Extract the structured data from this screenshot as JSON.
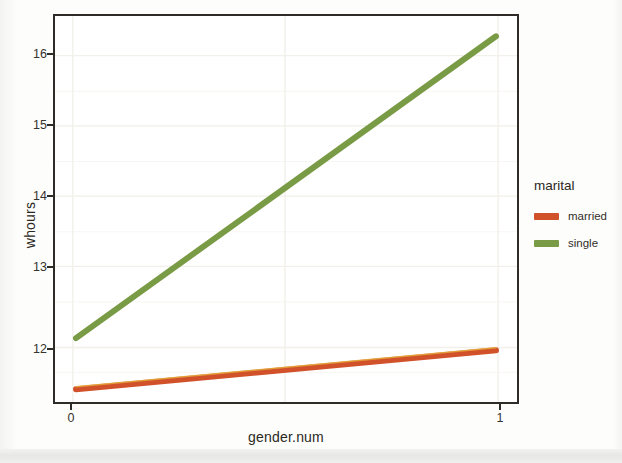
{
  "chart_data": {
    "type": "line",
    "title": "",
    "xlabel": "gender.num",
    "ylabel": "whours",
    "x": [
      0,
      1
    ],
    "xlim": [
      -0.05,
      1.05
    ],
    "ylim": [
      11.38,
      16.52
    ],
    "xticks": [
      "0",
      "1"
    ],
    "yticks": [
      "12",
      "13",
      "14",
      "15",
      "16"
    ],
    "ytick_values": [
      12,
      13,
      14,
      15,
      16
    ],
    "grid": true,
    "legend_position": "right",
    "legend_title": "marital",
    "series": [
      {
        "name": "married",
        "color": "#d1522a",
        "values": [
          11.55,
          12.07
        ]
      },
      {
        "name": "single",
        "color": "#7a9b45",
        "values": [
          12.23,
          16.25
        ]
      }
    ]
  },
  "axes": {
    "y_title": "whours",
    "x_title": "gender.num",
    "y_tick_labels": [
      "16",
      "15",
      "14",
      "13",
      "12"
    ],
    "x_tick_labels": [
      "0",
      "1"
    ]
  },
  "legend": {
    "title": "marital",
    "entries": [
      {
        "label": "married",
        "color": "#d1522a",
        "swatch": "line-swatch-married"
      },
      {
        "label": "single",
        "color": "#7a9b45",
        "swatch": "line-swatch-single"
      }
    ]
  },
  "colors": {
    "married": "#d1522a",
    "single": "#7a9b45",
    "panel_border": "#2f2c27",
    "grid": "#f0efe9",
    "text": "#2b2822",
    "background": "#ffffff"
  }
}
